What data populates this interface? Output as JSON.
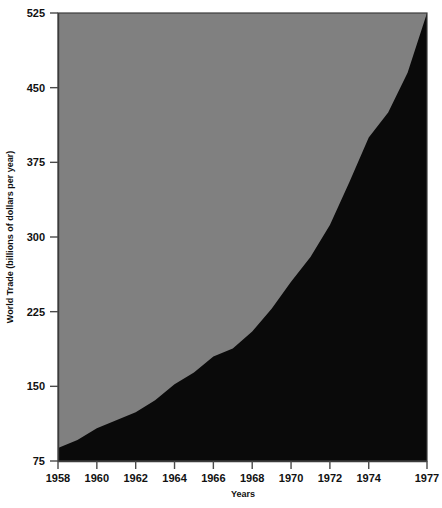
{
  "chart_data": {
    "type": "area",
    "title": "",
    "xlabel": "Years",
    "ylabel": "World Trade (billions of dollars per year)",
    "x": [
      1958,
      1959,
      1960,
      1961,
      1962,
      1963,
      1964,
      1965,
      1966,
      1967,
      1968,
      1969,
      1970,
      1971,
      1972,
      1973,
      1974,
      1975,
      1976,
      1977
    ],
    "values": [
      88,
      96,
      108,
      116,
      124,
      136,
      152,
      164,
      180,
      188,
      205,
      228,
      255,
      280,
      312,
      355,
      400,
      425,
      465,
      525
    ],
    "series": [
      {
        "name": "World Trade",
        "values": [
          88,
          96,
          108,
          116,
          124,
          136,
          152,
          164,
          180,
          188,
          205,
          228,
          255,
          280,
          312,
          355,
          400,
          425,
          465,
          525
        ]
      }
    ],
    "xticks": [
      1958,
      1960,
      1962,
      1964,
      1966,
      1968,
      1970,
      1972,
      1974,
      1977
    ],
    "xtick_labels": [
      "1958",
      "1960",
      "1962",
      "1964",
      "1966",
      "1968",
      "1970",
      "1972",
      "1974",
      "1977"
    ],
    "yticks": [
      75,
      150,
      225,
      300,
      375,
      450,
      525
    ],
    "ytick_labels": [
      "75",
      "150",
      "225",
      "300",
      "375",
      "450",
      "525"
    ],
    "xlim": [
      1958,
      1977
    ],
    "ylim": [
      75,
      525
    ],
    "grid": false,
    "legend": "none",
    "fill_color": "#0a0a0a",
    "background_color": "#808080",
    "axis_color": "#4a4a4a"
  },
  "axes": {
    "x_title": "Years",
    "y_title": "World Trade (billions of dollars per year)"
  }
}
